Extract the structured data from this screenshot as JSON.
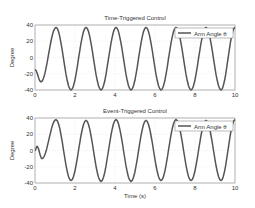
{
  "chart_data": [
    {
      "type": "line",
      "title": "Time-Triggered Control",
      "xlabel": "",
      "ylabel": "Degree",
      "xlim": [
        0,
        10
      ],
      "ylim": [
        -40,
        40
      ],
      "xticks": [
        "0",
        "2",
        "4",
        "6",
        "8",
        "10"
      ],
      "yticks": [
        "40",
        "20",
        "0",
        "-20",
        "-40"
      ],
      "grid": true,
      "legend": {
        "position": "upper right",
        "entries": [
          "Arm Angle θ"
        ]
      },
      "series": [
        {
          "name": "Arm Angle θ",
          "description": "oscillation ~±38°, period ~1.5s, initial dip to -30 at t≈0.3",
          "x": [
            0,
            0.3,
            1.05,
            1.8,
            2.55,
            3.3,
            4.05,
            4.8,
            5.55,
            6.3,
            7.05,
            7.8,
            8.55,
            9.3,
            10
          ],
          "y": [
            -15,
            -30,
            37,
            -40,
            37,
            -40,
            37,
            -40,
            37,
            -40,
            37,
            -40,
            37,
            -40,
            37
          ]
        }
      ]
    },
    {
      "type": "line",
      "title": "Event-Triggered Control",
      "xlabel": "Time (s)",
      "ylabel": "Degree",
      "xlim": [
        0,
        10
      ],
      "ylim": [
        -40,
        40
      ],
      "xticks": [
        "0",
        "2",
        "4",
        "6",
        "8",
        "10"
      ],
      "yticks": [
        "40",
        "20",
        "0",
        "-20",
        "-40"
      ],
      "grid": true,
      "legend": {
        "position": "upper right",
        "entries": [
          "Arm Angle θ"
        ]
      },
      "series": [
        {
          "name": "Arm Angle θ",
          "description": "small bump then oscillation ~±38°, period ~1.5s",
          "x": [
            0,
            0.1,
            0.35,
            1.05,
            1.8,
            2.55,
            3.3,
            4.05,
            4.8,
            5.55,
            6.3,
            7.05,
            7.8,
            8.55,
            9.3,
            10
          ],
          "y": [
            0,
            5,
            -10,
            38,
            -37,
            37,
            -38,
            38,
            -38,
            37,
            -37,
            38,
            -37,
            37,
            -37,
            38
          ]
        }
      ]
    }
  ],
  "titles": [
    "Time-Triggered Control",
    "Event-Triggered Control"
  ],
  "ylabel": "Degree",
  "xlabel": "Time (s)",
  "legend_label": "Arm Angle θ"
}
